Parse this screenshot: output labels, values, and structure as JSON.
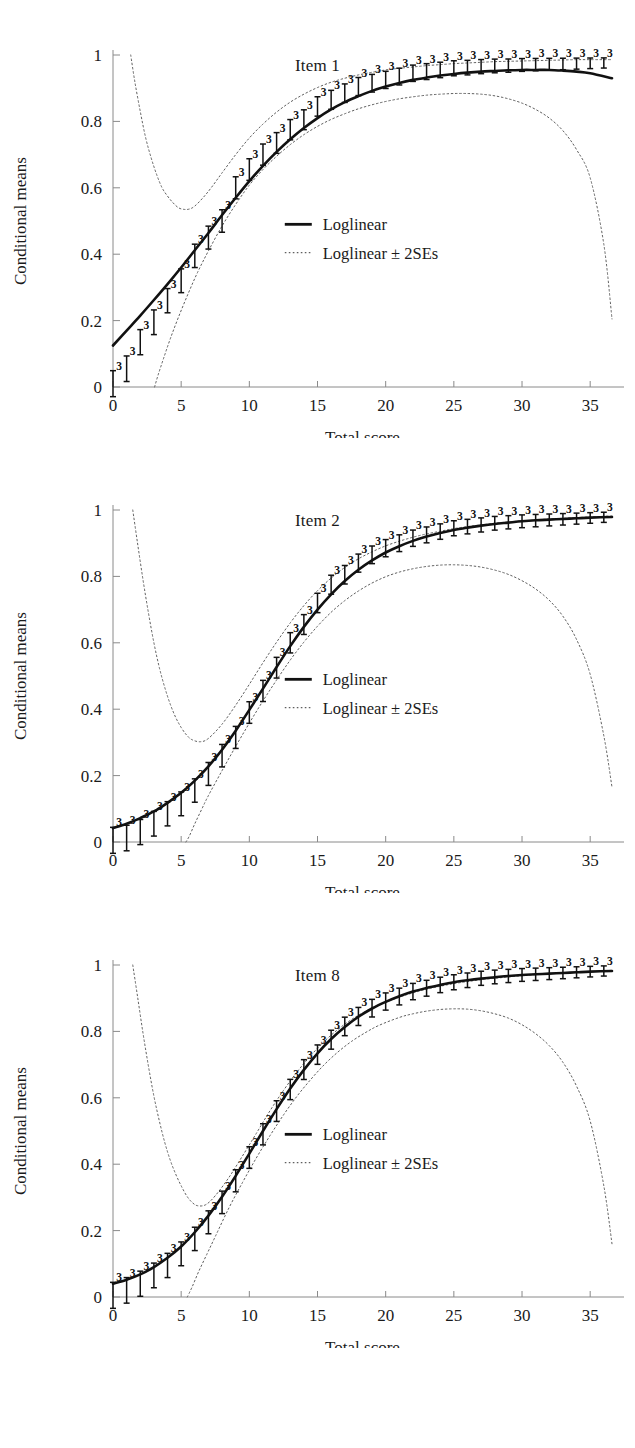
{
  "figure": {
    "panel_count": 3,
    "background": "#ffffff",
    "line_color": "#111111",
    "band_color": "#5f5f5f"
  },
  "axis": {
    "x_title": "Total score",
    "y_title": "Conditional means",
    "x_ticks": [
      "0",
      "5",
      "10",
      "15",
      "20",
      "25",
      "30",
      "35"
    ],
    "y_ticks": [
      "0",
      "0.2",
      "0.4",
      "0.6",
      "0.8",
      "1"
    ],
    "x_min": 0,
    "x_max": 36.6,
    "y_min": 0,
    "y_max": 1
  },
  "legend": {
    "solid_label": "Loglinear",
    "dotted_label": "Loglinear ± 2SEs"
  },
  "panels": [
    {
      "title": "Item 1"
    },
    {
      "title": "Item 2"
    },
    {
      "title": "Item 8"
    }
  ],
  "chart_data": [
    {
      "type": "line",
      "title": "Item 1",
      "xlabel": "Total score",
      "ylabel": "Conditional means",
      "xlim": [
        0,
        36.6
      ],
      "ylim": [
        0,
        1
      ],
      "xticks": [
        0,
        5,
        10,
        15,
        20,
        25,
        30,
        35
      ],
      "yticks": [
        0,
        0.2,
        0.4,
        0.6,
        0.8,
        1
      ],
      "grid": false,
      "legend_position": "center",
      "legend_entries": [
        "Loglinear",
        "Loglinear ± 2SEs"
      ],
      "series": [
        {
          "name": "Loglinear",
          "style": "solid",
          "x": [
            0,
            1,
            2,
            3,
            4,
            5,
            6,
            7,
            8,
            9,
            10,
            11,
            12,
            13,
            14,
            15,
            16,
            17,
            18,
            19,
            20,
            21,
            22,
            23,
            24,
            25,
            26,
            27,
            28,
            29,
            30,
            31,
            32,
            33,
            34,
            35,
            36.6
          ],
          "values": [
            0.125,
            0.17,
            0.215,
            0.262,
            0.31,
            0.36,
            0.412,
            0.464,
            0.518,
            0.57,
            0.62,
            0.666,
            0.708,
            0.746,
            0.78,
            0.81,
            0.836,
            0.858,
            0.876,
            0.892,
            0.905,
            0.916,
            0.925,
            0.932,
            0.938,
            0.943,
            0.947,
            0.95,
            0.952,
            0.954,
            0.955,
            0.955,
            0.955,
            0.953,
            0.95,
            0.945,
            0.93
          ]
        },
        {
          "name": "Loglinear + 2SEs",
          "style": "dotted",
          "x": [
            1.3,
            1.6,
            2.0,
            2.4,
            2.8,
            3.2,
            3.6,
            4.0,
            4.4,
            4.8,
            5.2,
            5.6,
            6.0,
            6.6,
            7.2,
            8,
            9,
            10,
            11,
            12,
            13,
            14,
            15,
            16,
            17,
            18,
            19,
            20,
            21,
            22,
            23,
            24,
            25,
            26,
            27,
            28,
            29,
            30,
            31,
            32,
            33,
            34,
            35,
            36.6
          ],
          "values": [
            1.0,
            0.92,
            0.83,
            0.75,
            0.69,
            0.64,
            0.6,
            0.575,
            0.555,
            0.54,
            0.535,
            0.536,
            0.545,
            0.57,
            0.6,
            0.645,
            0.7,
            0.75,
            0.792,
            0.828,
            0.858,
            0.882,
            0.902,
            0.918,
            0.93,
            0.94,
            0.948,
            0.955,
            0.96,
            0.964,
            0.968,
            0.971,
            0.974,
            0.976,
            0.978,
            0.98,
            0.981,
            0.982,
            0.983,
            0.984,
            0.985,
            0.986,
            0.986,
            0.986
          ]
        },
        {
          "name": "Loglinear - 2SEs",
          "style": "dotted",
          "x": [
            3.05,
            3.3,
            3.7,
            4.2,
            4.8,
            5.5,
            6.2,
            7,
            8,
            9,
            10,
            11,
            12,
            13,
            14,
            15,
            16,
            17,
            18,
            19,
            20,
            21,
            22,
            23,
            24,
            25,
            26,
            27,
            28,
            29,
            30,
            31,
            32,
            33,
            34,
            35,
            36,
            36.6
          ],
          "values": [
            0.0,
            0.035,
            0.085,
            0.145,
            0.21,
            0.28,
            0.345,
            0.41,
            0.485,
            0.55,
            0.608,
            0.655,
            0.695,
            0.73,
            0.76,
            0.785,
            0.806,
            0.823,
            0.838,
            0.85,
            0.86,
            0.868,
            0.874,
            0.879,
            0.882,
            0.884,
            0.884,
            0.882,
            0.877,
            0.868,
            0.855,
            0.836,
            0.81,
            0.772,
            0.715,
            0.63,
            0.43,
            0.205
          ]
        }
      ],
      "observed_points": {
        "label_glyph": "3",
        "x": [
          0,
          1,
          2,
          3,
          4,
          5,
          6,
          7,
          8,
          9,
          10,
          11,
          12,
          13,
          14,
          15,
          16,
          17,
          18,
          19,
          20,
          21,
          22,
          23,
          24,
          25,
          26,
          27,
          28,
          29,
          30,
          31,
          32,
          33,
          34,
          35,
          36
        ],
        "values": [
          0.01,
          0.055,
          0.135,
          0.195,
          0.26,
          0.32,
          0.395,
          0.45,
          0.5,
          0.6,
          0.655,
          0.7,
          0.735,
          0.775,
          0.805,
          0.845,
          0.865,
          0.885,
          0.905,
          0.915,
          0.925,
          0.935,
          0.945,
          0.95,
          0.955,
          0.96,
          0.962,
          0.965,
          0.967,
          0.968,
          0.97,
          0.971,
          0.972,
          0.973,
          0.974,
          0.975,
          0.976
        ]
      }
    },
    {
      "type": "line",
      "title": "Item 2",
      "xlabel": "Total score",
      "ylabel": "Conditional means",
      "xlim": [
        0,
        36.6
      ],
      "ylim": [
        0,
        1
      ],
      "xticks": [
        0,
        5,
        10,
        15,
        20,
        25,
        30,
        35
      ],
      "yticks": [
        0,
        0.2,
        0.4,
        0.6,
        0.8,
        1
      ],
      "grid": false,
      "legend_position": "center",
      "legend_entries": [
        "Loglinear",
        "Loglinear ± 2SEs"
      ],
      "series": [
        {
          "name": "Loglinear",
          "style": "solid",
          "x": [
            0,
            1,
            2,
            3,
            4,
            5,
            6,
            7,
            8,
            9,
            10,
            11,
            12,
            13,
            14,
            15,
            16,
            17,
            18,
            19,
            20,
            21,
            22,
            23,
            24,
            25,
            26,
            27,
            28,
            29,
            30,
            31,
            32,
            33,
            34,
            35,
            36.6
          ],
          "values": [
            0.042,
            0.055,
            0.072,
            0.092,
            0.118,
            0.148,
            0.185,
            0.228,
            0.278,
            0.335,
            0.398,
            0.462,
            0.527,
            0.59,
            0.648,
            0.7,
            0.746,
            0.786,
            0.82,
            0.848,
            0.872,
            0.891,
            0.907,
            0.92,
            0.931,
            0.94,
            0.947,
            0.953,
            0.958,
            0.962,
            0.966,
            0.969,
            0.971,
            0.973,
            0.975,
            0.977,
            0.979
          ]
        },
        {
          "name": "Loglinear + 2SEs",
          "style": "dotted",
          "x": [
            1.45,
            1.8,
            2.2,
            2.6,
            3.0,
            3.4,
            3.8,
            4.2,
            4.6,
            5.0,
            5.4,
            5.8,
            6.4,
            7,
            8,
            9,
            10,
            11,
            12,
            13,
            14,
            15,
            16,
            17,
            18,
            19,
            20,
            21,
            22,
            23,
            24,
            25,
            26,
            27,
            28,
            29,
            30,
            31,
            32,
            33,
            34,
            35,
            36.6
          ],
          "values": [
            1.0,
            0.9,
            0.79,
            0.69,
            0.6,
            0.525,
            0.465,
            0.415,
            0.375,
            0.345,
            0.322,
            0.308,
            0.302,
            0.312,
            0.355,
            0.412,
            0.475,
            0.54,
            0.602,
            0.66,
            0.712,
            0.757,
            0.795,
            0.827,
            0.853,
            0.874,
            0.892,
            0.906,
            0.918,
            0.928,
            0.936,
            0.944,
            0.95,
            0.955,
            0.96,
            0.964,
            0.967,
            0.97,
            0.973,
            0.975,
            0.977,
            0.979,
            0.982
          ]
        },
        {
          "name": "Loglinear - 2SEs",
          "style": "dotted",
          "x": [
            5.35,
            5.6,
            6,
            6.5,
            7,
            8,
            9,
            10,
            11,
            12,
            13,
            14,
            15,
            16,
            17,
            18,
            19,
            20,
            21,
            22,
            23,
            24,
            25,
            26,
            27,
            28,
            29,
            30,
            31,
            32,
            33,
            34,
            35,
            36,
            36.6
          ],
          "values": [
            0.0,
            0.018,
            0.055,
            0.098,
            0.14,
            0.215,
            0.288,
            0.358,
            0.425,
            0.488,
            0.548,
            0.602,
            0.65,
            0.692,
            0.727,
            0.756,
            0.78,
            0.799,
            0.813,
            0.823,
            0.83,
            0.834,
            0.835,
            0.833,
            0.828,
            0.819,
            0.806,
            0.787,
            0.762,
            0.728,
            0.68,
            0.61,
            0.505,
            0.32,
            0.165
          ]
        }
      ],
      "observed_points": {
        "label_glyph": "3",
        "x": [
          0,
          1,
          2,
          3,
          4,
          5,
          6,
          7,
          8,
          9,
          10,
          11,
          12,
          13,
          14,
          15,
          16,
          17,
          18,
          19,
          20,
          21,
          22,
          23,
          24,
          25,
          26,
          27,
          28,
          29,
          30,
          31,
          32,
          33,
          34,
          35,
          36
        ],
        "values": [
          0.005,
          0.012,
          0.03,
          0.055,
          0.085,
          0.115,
          0.155,
          0.205,
          0.26,
          0.315,
          0.39,
          0.455,
          0.525,
          0.6,
          0.655,
          0.72,
          0.775,
          0.805,
          0.84,
          0.865,
          0.885,
          0.9,
          0.915,
          0.925,
          0.935,
          0.945,
          0.95,
          0.955,
          0.96,
          0.963,
          0.966,
          0.968,
          0.97,
          0.972,
          0.974,
          0.976,
          0.978
        ]
      }
    },
    {
      "type": "line",
      "title": "Item 8",
      "xlabel": "Total score",
      "ylabel": "Conditional means",
      "xlim": [
        0,
        36.6
      ],
      "ylim": [
        0,
        1
      ],
      "xticks": [
        0,
        5,
        10,
        15,
        20,
        25,
        30,
        35
      ],
      "yticks": [
        0,
        0.2,
        0.4,
        0.6,
        0.8,
        1
      ],
      "grid": false,
      "legend_position": "center",
      "legend_entries": [
        "Loglinear",
        "Loglinear ± 2SEs"
      ],
      "series": [
        {
          "name": "Loglinear",
          "style": "solid",
          "x": [
            0,
            1,
            2,
            3,
            4,
            5,
            6,
            7,
            8,
            9,
            10,
            11,
            12,
            13,
            14,
            15,
            16,
            17,
            18,
            19,
            20,
            21,
            22,
            23,
            24,
            25,
            26,
            27,
            28,
            29,
            30,
            31,
            32,
            33,
            34,
            35,
            36.6
          ],
          "values": [
            0.04,
            0.052,
            0.068,
            0.09,
            0.118,
            0.152,
            0.195,
            0.245,
            0.302,
            0.365,
            0.432,
            0.5,
            0.566,
            0.628,
            0.684,
            0.734,
            0.777,
            0.813,
            0.844,
            0.869,
            0.889,
            0.906,
            0.92,
            0.931,
            0.94,
            0.948,
            0.954,
            0.959,
            0.963,
            0.967,
            0.97,
            0.972,
            0.974,
            0.976,
            0.978,
            0.98,
            0.982
          ]
        },
        {
          "name": "Loglinear + 2SEs",
          "style": "dotted",
          "x": [
            1.45,
            1.8,
            2.2,
            2.6,
            3.0,
            3.4,
            3.8,
            4.2,
            4.6,
            5.0,
            5.4,
            5.8,
            6.2,
            6.8,
            7.5,
            8.5,
            9.5,
            10.5,
            11.5,
            12.5,
            13.5,
            14.5,
            15.5,
            16.5,
            17.5,
            18.5,
            19.5,
            21,
            22,
            23,
            24,
            25,
            26,
            27,
            28,
            29,
            30,
            31,
            32,
            33,
            34,
            35,
            36.6
          ],
          "values": [
            1.0,
            0.905,
            0.795,
            0.695,
            0.605,
            0.53,
            0.465,
            0.412,
            0.37,
            0.335,
            0.305,
            0.285,
            0.275,
            0.278,
            0.305,
            0.36,
            0.425,
            0.492,
            0.56,
            0.622,
            0.678,
            0.727,
            0.77,
            0.806,
            0.836,
            0.86,
            0.88,
            0.903,
            0.916,
            0.927,
            0.936,
            0.944,
            0.95,
            0.956,
            0.96,
            0.964,
            0.968,
            0.971,
            0.974,
            0.976,
            0.978,
            0.98,
            0.984
          ]
        },
        {
          "name": "Loglinear - 2SEs",
          "style": "dotted",
          "x": [
            5.45,
            5.8,
            6.3,
            6.9,
            7.5,
            8.5,
            9.5,
            10.5,
            11.5,
            12.5,
            13.5,
            14.5,
            15.5,
            16.5,
            17.5,
            18.5,
            19.5,
            21,
            22,
            23,
            24,
            25,
            26,
            27,
            28,
            29,
            30,
            31,
            32,
            33,
            34,
            35,
            36,
            36.6
          ],
          "values": [
            0.0,
            0.03,
            0.078,
            0.13,
            0.182,
            0.268,
            0.345,
            0.418,
            0.485,
            0.548,
            0.605,
            0.655,
            0.7,
            0.738,
            0.77,
            0.796,
            0.818,
            0.842,
            0.853,
            0.861,
            0.866,
            0.868,
            0.867,
            0.862,
            0.853,
            0.84,
            0.82,
            0.793,
            0.757,
            0.707,
            0.635,
            0.53,
            0.335,
            0.16
          ]
        }
      ],
      "observed_points": {
        "label_glyph": "3",
        "x": [
          0,
          1,
          2,
          3,
          4,
          5,
          6,
          7,
          8,
          9,
          10,
          11,
          12,
          13,
          14,
          15,
          16,
          17,
          18,
          19,
          20,
          21,
          22,
          23,
          24,
          25,
          26,
          27,
          28,
          29,
          30,
          31,
          32,
          33,
          34,
          35,
          36
        ],
        "values": [
          0.005,
          0.02,
          0.04,
          0.065,
          0.095,
          0.13,
          0.175,
          0.225,
          0.285,
          0.35,
          0.42,
          0.49,
          0.56,
          0.625,
          0.685,
          0.73,
          0.775,
          0.815,
          0.845,
          0.87,
          0.89,
          0.905,
          0.92,
          0.93,
          0.94,
          0.948,
          0.954,
          0.96,
          0.964,
          0.967,
          0.97,
          0.972,
          0.974,
          0.976,
          0.978,
          0.98,
          0.982
        ]
      }
    }
  ]
}
